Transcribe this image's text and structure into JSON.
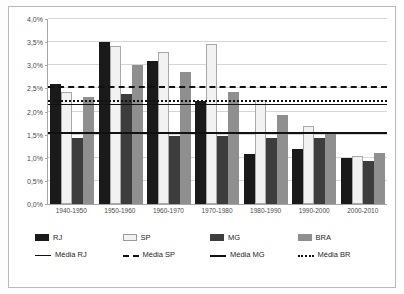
{
  "chart_data": {
    "type": "bar",
    "title": "",
    "xlabel": "",
    "ylabel": "",
    "ylim": [
      0,
      4
    ],
    "ytick_labels": [
      "0,0%",
      "0,5%",
      "1,0%",
      "1,5%",
      "2,0%",
      "2,5%",
      "3,0%",
      "3,5%",
      "4,0%"
    ],
    "ytick_values": [
      0,
      0.5,
      1.0,
      1.5,
      2.0,
      2.5,
      3.0,
      3.5,
      4.0
    ],
    "grid": true,
    "legend_position": "bottom",
    "categories": [
      "1940-1950",
      "1950-1960",
      "1960-1970",
      "1970-1980",
      "1980-1990",
      "1990-2000",
      "2000-2010"
    ],
    "series": [
      {
        "name": "RJ",
        "color": "#1a1a1a",
        "values": [
          2.6,
          3.5,
          3.1,
          2.23,
          1.09,
          1.2,
          1.0
        ]
      },
      {
        "name": "SP",
        "color": "#f2f2f2",
        "values": [
          2.43,
          3.41,
          3.29,
          3.46,
          2.25,
          1.68,
          1.03
        ]
      },
      {
        "name": "MG",
        "color": "#3d3d3d",
        "values": [
          1.42,
          2.37,
          1.47,
          1.47,
          1.42,
          1.43,
          0.93
        ]
      },
      {
        "name": "BRA",
        "color": "#8f8f8f",
        "values": [
          2.32,
          3.01,
          2.85,
          2.43,
          1.93,
          1.55,
          1.11
        ]
      }
    ],
    "reference_lines": [
      {
        "name": "Média RJ",
        "value": 2.15,
        "style": "solid"
      },
      {
        "name": "Média SP",
        "value": 2.51,
        "style": "dashed"
      },
      {
        "name": "Média MG",
        "value": 1.51,
        "style": "solid-thick"
      },
      {
        "name": "Média BR",
        "value": 2.21,
        "style": "dotted"
      }
    ]
  },
  "legend": {
    "bars": [
      {
        "label": "RJ"
      },
      {
        "label": "SP"
      },
      {
        "label": "MG"
      },
      {
        "label": "BRA"
      }
    ],
    "lines": [
      {
        "label": "Média RJ"
      },
      {
        "label": "Média SP"
      },
      {
        "label": "Média MG"
      },
      {
        "label": "Média BR"
      }
    ]
  }
}
